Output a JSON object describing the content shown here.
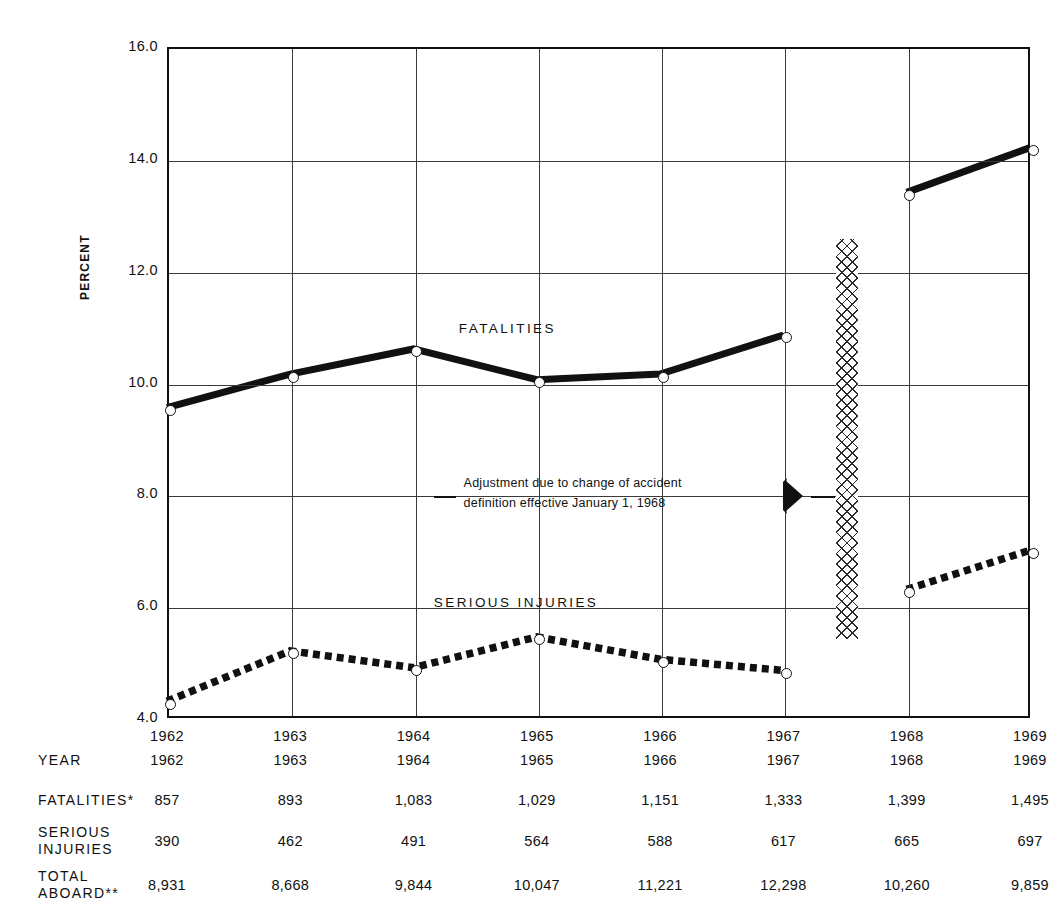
{
  "chart_data": {
    "type": "line",
    "title": "",
    "xlabel": "YEAR",
    "ylabel": "PERCENT",
    "ylim": [
      4.0,
      16.0
    ],
    "ytick_labels": [
      "16.0",
      "14.0",
      "12.0",
      "10.0",
      "8.0",
      "6.0",
      "4.0"
    ],
    "ytick_values": [
      16.0,
      14.0,
      12.0,
      10.0,
      8.0,
      6.0,
      4.0
    ],
    "grid": true,
    "legend_position": "inline-labels",
    "categories": [
      "1962",
      "1963",
      "1964",
      "1965",
      "1966",
      "1967",
      "1968",
      "1969"
    ],
    "x": [
      1962,
      1963,
      1964,
      1965,
      1966,
      1967,
      1968,
      1969
    ],
    "series": [
      {
        "name": "FATALITIES",
        "style": "solid-thick",
        "values": [
          9.55,
          10.15,
          10.6,
          10.05,
          10.15,
          10.85,
          13.4,
          14.2
        ],
        "break_after_index": 5
      },
      {
        "name": "SERIOUS INJURIES",
        "style": "dashed-thick",
        "values": [
          4.3,
          5.2,
          4.9,
          5.45,
          5.05,
          4.85,
          6.3,
          7.0
        ],
        "break_after_index": 5
      }
    ],
    "annotations": [
      {
        "name": "adjustment-note",
        "line1": "Adjustment due to change of accident",
        "line2": "definition effective January 1, 1968",
        "value": 8.0
      }
    ],
    "separator_band": {
      "name": "adjustment-break-band",
      "between": [
        "1967",
        "1968"
      ],
      "style": "cross-hatch"
    }
  },
  "table": {
    "rows": [
      {
        "label": "YEAR",
        "label_lines": [
          "YEAR"
        ],
        "values": [
          "1962",
          "1963",
          "1964",
          "1965",
          "1966",
          "1967",
          "1968",
          "1969"
        ]
      },
      {
        "label": "FATALITIES*",
        "label_lines": [
          "FATALITIES*"
        ],
        "values": [
          "857",
          "893",
          "1,083",
          "1,029",
          "1,151",
          "1,333",
          "1,399",
          "1,495"
        ]
      },
      {
        "label": "SERIOUS INJURIES",
        "label_lines": [
          "SERIOUS",
          "INJURIES"
        ],
        "values": [
          "390",
          "462",
          "491",
          "564",
          "588",
          "617",
          "665",
          "697"
        ]
      },
      {
        "label": "TOTAL ABOARD**",
        "label_lines": [
          "TOTAL",
          "ABOARD**"
        ],
        "values": [
          "8,931",
          "8,668",
          "9,844",
          "10,047",
          "11,221",
          "12,298",
          "10,260",
          "9,859"
        ]
      }
    ]
  },
  "colors": {
    "ink": "#111111",
    "grid": "#3a3a3a",
    "background": "#ffffff"
  }
}
